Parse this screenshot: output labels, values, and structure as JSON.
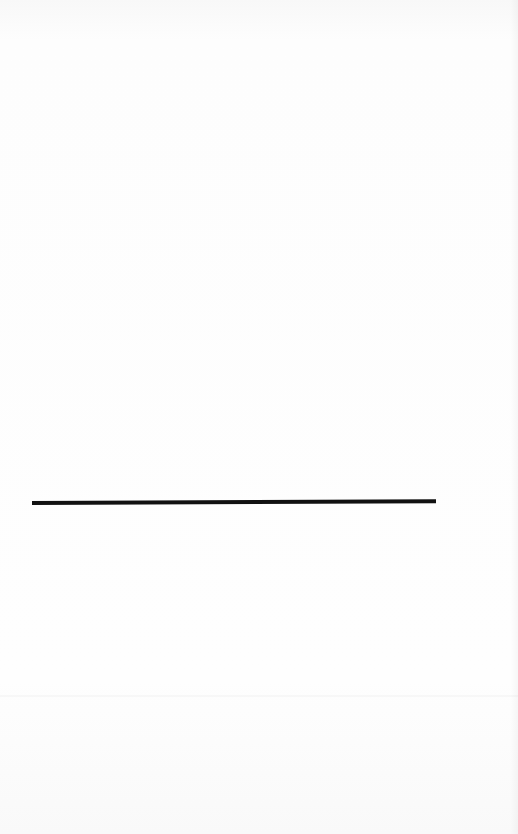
{
  "document": {
    "type": "scanned-blank-page",
    "elements": [
      {
        "kind": "horizontal-rule",
        "color": "#111111"
      }
    ]
  }
}
